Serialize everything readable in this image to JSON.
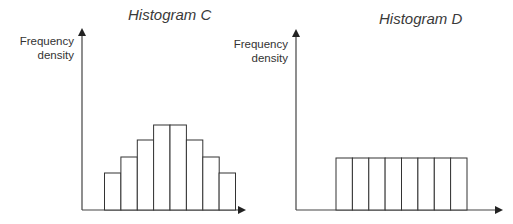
{
  "chart_data": [
    {
      "type": "bar",
      "title": "Histogram C",
      "xlabel": "",
      "ylabel": "Frequency density",
      "categories": [
        "1",
        "2",
        "3",
        "4",
        "5",
        "6",
        "7",
        "8"
      ],
      "values": [
        37,
        53,
        70,
        85,
        85,
        70,
        53,
        37
      ],
      "grid": false,
      "legend": null,
      "note": "Symmetric, bell-shaped histogram; values are relative bar heights in pixels (no axis ticks shown)"
    },
    {
      "type": "bar",
      "title": "Histogram D",
      "xlabel": "",
      "ylabel": "Frequency density",
      "categories": [
        "1",
        "2",
        "3",
        "4",
        "5",
        "6",
        "7",
        "8"
      ],
      "values": [
        52,
        52,
        52,
        52,
        52,
        52,
        52,
        52
      ],
      "grid": false,
      "legend": null,
      "note": "Uniform histogram; values are relative bar heights in pixels (no axis ticks shown)"
    }
  ],
  "panels": {
    "c": {
      "title": "Histogram C",
      "ylabel_line1": "Frequency",
      "ylabel_line2": "density"
    },
    "d": {
      "title": "Histogram D",
      "ylabel_line1": "Frequency",
      "ylabel_line2": "density"
    }
  },
  "colors": {
    "stroke": "#333333",
    "fill": "#ffffff"
  }
}
